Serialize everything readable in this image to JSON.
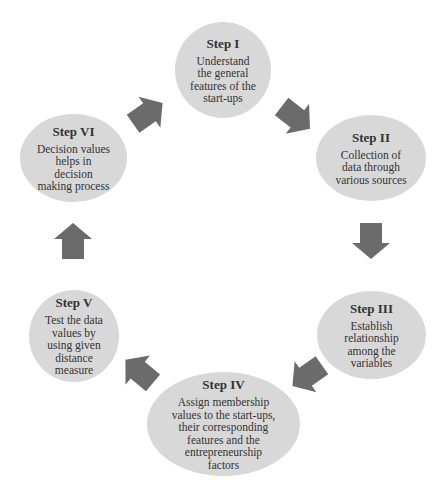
{
  "diagram": {
    "type": "cycle",
    "colors": {
      "node_fill": "#d8d8d8",
      "arrow_fill": "#6b6b6b",
      "text": "#333333"
    },
    "steps": [
      {
        "title": "Step I",
        "lines": [
          "Understand",
          "the general",
          "features of the",
          "start-ups"
        ]
      },
      {
        "title": "Step II",
        "lines": [
          "Collection of",
          "data through",
          "various sources"
        ]
      },
      {
        "title": "Step III",
        "lines": [
          "Establish",
          "relationship",
          "among the",
          "variables"
        ]
      },
      {
        "title": "Step IV",
        "lines": [
          "Assign membership",
          "values to the start-ups,",
          "their corresponding",
          "features and the",
          "entrepreneurship",
          "factors"
        ]
      },
      {
        "title": "Step V",
        "lines": [
          "Test the data",
          "values by",
          "using given",
          "distance",
          "measure"
        ]
      },
      {
        "title": "Step VI",
        "lines": [
          "Decision values",
          "helps in",
          "decision",
          "making process"
        ]
      }
    ],
    "arrows": [
      {
        "from": "Step I",
        "to": "Step II",
        "icon": "arrow-down-right-icon"
      },
      {
        "from": "Step II",
        "to": "Step III",
        "icon": "arrow-down-icon"
      },
      {
        "from": "Step III",
        "to": "Step IV",
        "icon": "arrow-down-left-icon"
      },
      {
        "from": "Step IV",
        "to": "Step V",
        "icon": "arrow-up-left-icon"
      },
      {
        "from": "Step V",
        "to": "Step VI",
        "icon": "arrow-up-icon"
      },
      {
        "from": "Step VI",
        "to": "Step I",
        "icon": "arrow-up-right-icon"
      }
    ]
  }
}
